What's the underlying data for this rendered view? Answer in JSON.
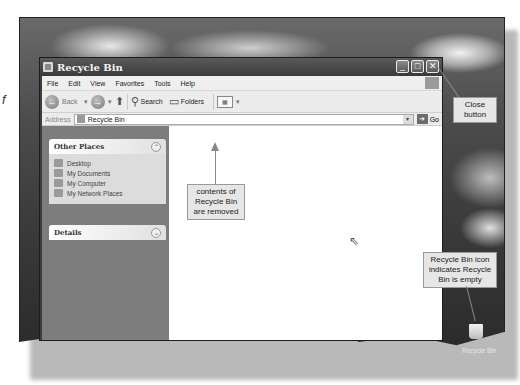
{
  "page_fragment": {
    "stray_text": "f"
  },
  "window": {
    "title": "Recycle Bin",
    "caption_buttons": [
      "minimize",
      "maximize",
      "close"
    ],
    "caption_glyphs": {
      "minimize": "_",
      "maximize": "□",
      "close": "✕"
    }
  },
  "menubar": {
    "items": [
      "File",
      "Edit",
      "View",
      "Favorites",
      "Tools",
      "Help"
    ]
  },
  "toolbar": {
    "back_label": "Back",
    "back_glyph": "←",
    "forward_glyph": "→",
    "dropdown_glyph": "▾",
    "up_glyph": "⬆",
    "search_glyph": "⚲",
    "search_label": "Search",
    "folders_glyph": "▭",
    "folders_label": "Folders",
    "views_glyph": "▦"
  },
  "addressbar": {
    "label": "Address",
    "value": "Recycle Bin",
    "dropdown_glyph": "▾",
    "go_glyph": "➔",
    "go_label": "Go"
  },
  "taskpane": {
    "other_places": {
      "title": "Other Places",
      "chevron": "⌃",
      "links": [
        "Desktop",
        "My Documents",
        "My Computer",
        "My Network Places"
      ]
    },
    "details": {
      "title": "Details",
      "chevron": "⌄"
    }
  },
  "content": {
    "cursor_glyph": "⇖"
  },
  "callouts": {
    "close_button": "Close button",
    "contents_removed": "contents of Recycle Bin are removed",
    "bin_empty": "Recycle Bin icon indicates Recycle Bin is empty"
  },
  "desktop": {
    "recycle_bin_label": "Recycle Bin"
  }
}
